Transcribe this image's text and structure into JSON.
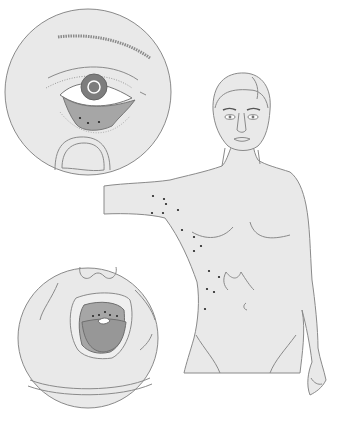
{
  "canvas": {
    "width": 354,
    "height": 421,
    "background": "#ffffff"
  },
  "colors": {
    "fill": "#e9e9e9",
    "stroke": "#8a8a8a",
    "dark": "#7d7d7d",
    "mid": "#a6a6a6",
    "white": "#ffffff",
    "dot": "#222222"
  },
  "eye_inset": {
    "cx": 88,
    "cy": 92,
    "r": 83
  },
  "mouth_inset": {
    "cx": 88,
    "cy": 338,
    "r": 70
  },
  "torso_dots": [
    [
      153,
      196
    ],
    [
      164,
      199
    ],
    [
      166,
      204
    ],
    [
      152,
      213
    ],
    [
      163,
      213
    ],
    [
      178,
      210
    ],
    [
      182,
      230
    ],
    [
      194,
      237
    ],
    [
      201,
      246
    ],
    [
      194,
      251
    ],
    [
      209,
      271
    ],
    [
      219,
      277
    ],
    [
      207,
      289
    ],
    [
      214,
      292
    ],
    [
      205,
      309
    ]
  ],
  "conjunctiva_dots": [
    [
      80,
      118
    ],
    [
      88,
      123
    ],
    [
      99,
      122
    ]
  ],
  "palate_dots": [
    [
      93,
      316
    ],
    [
      99,
      315
    ],
    [
      105,
      312
    ],
    [
      110,
      315
    ],
    [
      117,
      316
    ]
  ]
}
